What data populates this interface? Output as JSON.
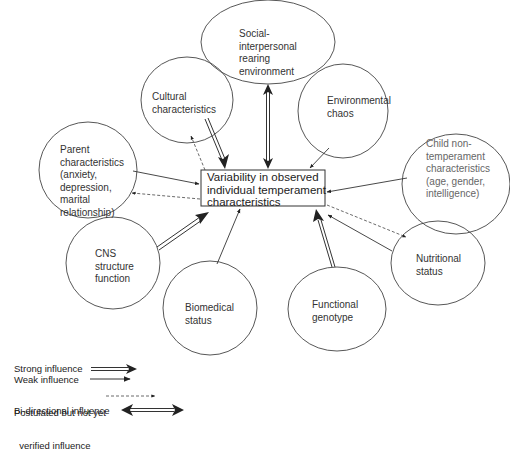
{
  "center": {
    "lines": [
      "Variability in observed",
      "individual temperament",
      "characteristics"
    ]
  },
  "nodes": [
    {
      "id": "social",
      "lines": [
        "Social-",
        "interpersonal",
        "rearing",
        "environment"
      ],
      "influence": "bi-directional"
    },
    {
      "id": "cultural",
      "lines": [
        "Cultural",
        "characteristics"
      ],
      "influence": "strong + postulated reverse"
    },
    {
      "id": "environmental",
      "lines": [
        "Environmental",
        "chaos"
      ],
      "influence": "weak"
    },
    {
      "id": "parent",
      "lines": [
        "Parent",
        "characteristics",
        "(anxiety,",
        "depression,",
        "marital",
        "relationship)"
      ],
      "influence": "weak + postulated reverse"
    },
    {
      "id": "child",
      "lines": [
        "Child non-",
        "temperament",
        "characteristics",
        "(age, gender,",
        "intelligence)"
      ],
      "influence": "weak"
    },
    {
      "id": "cns",
      "lines": [
        "CNS",
        "structure",
        "function"
      ],
      "influence": "strong"
    },
    {
      "id": "biomedical",
      "lines": [
        "Biomedical",
        "status"
      ],
      "influence": "weak"
    },
    {
      "id": "genotype",
      "lines": [
        "Functional",
        "genotype"
      ],
      "influence": "strong"
    },
    {
      "id": "nutritional",
      "lines": [
        "Nutritional",
        "status"
      ],
      "influence": "weak + postulated reverse"
    }
  ],
  "legend": {
    "items": [
      {
        "type": "strong",
        "lines": [
          "Strong influence"
        ]
      },
      {
        "type": "weak",
        "lines": [
          "Weak influence"
        ]
      },
      {
        "type": "postulated",
        "lines": [
          "Postulated but not yet",
          "  verified influence"
        ]
      },
      {
        "type": "bidirectional",
        "lines": [
          "Bi-directional influence"
        ]
      }
    ]
  },
  "colors": {
    "stroke": "#333333",
    "text": "#333333",
    "background": "#ffffff"
  }
}
